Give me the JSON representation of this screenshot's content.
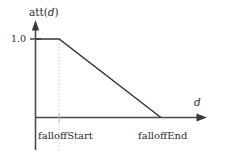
{
  "chart_data": {
    "type": "line",
    "title": "",
    "subtitle": "",
    "xlabel": "d",
    "ylabel": "att(d)",
    "ylabel_parts": {
      "prefix": "att(",
      "variable": "d",
      "suffix": ")"
    },
    "grid": false,
    "legend": "none",
    "xlim": [
      0,
      1.6
    ],
    "ylim": [
      0,
      1.25
    ],
    "ytick_labels": [
      "1.0"
    ],
    "ytick_values": [
      1.0
    ],
    "xtick_labels": [
      "falloffStart",
      "falloffEnd"
    ],
    "xtick_values": [
      0.23,
      1.22
    ],
    "series": [
      {
        "name": "att(d)",
        "x": [
          0,
          0.23,
          1.22
        ],
        "values": [
          1.0,
          1.0,
          0.0
        ]
      }
    ],
    "annotations": [
      {
        "name": "falloff-start-guide",
        "type": "vertical-dotted-line",
        "x": 0.23,
        "label": "falloffStart"
      }
    ],
    "colors": {
      "data_line": "#353535",
      "axis": "#4a4a4a",
      "guide_line": "#c9c9c9",
      "text": "#2b2b2b",
      "background": "#ffffff"
    }
  }
}
